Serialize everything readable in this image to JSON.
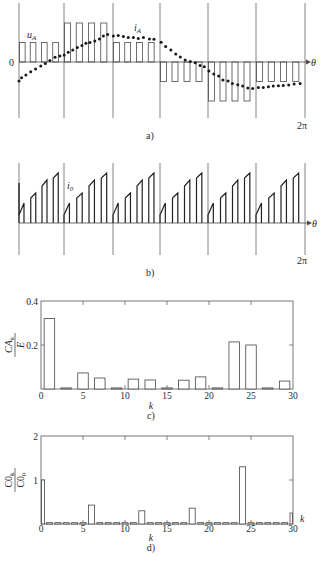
{
  "chart_data": [
    {
      "id": "a",
      "type": "line",
      "caption": "a)",
      "description": "Stepped PWM phase voltage u_A (6 segments x 4 pulses) with phase current i_A (dotted) over one period 0..2π",
      "origin_label": "0",
      "x_axis_symbol": "θ",
      "x_end_label": "2π",
      "u_label": "u",
      "u_label_sub": "A",
      "i_label": "i",
      "i_label_sub": "A",
      "segments": 6,
      "pulses_per_segment": 4,
      "u_A_segment_levels": [
        1,
        2,
        1,
        -1,
        -2,
        -1
      ],
      "i_A": {
        "theta_fraction_of_2pi": [
          0.0,
          0.009,
          0.024,
          0.041,
          0.058,
          0.076,
          0.092,
          0.108,
          0.126,
          0.143,
          0.158,
          0.172,
          0.188,
          0.204,
          0.22,
          0.234,
          0.248,
          0.265,
          0.281,
          0.295,
          0.31,
          0.33,
          0.347,
          0.365,
          0.382,
          0.4,
          0.417,
          0.435,
          0.456,
          0.472,
          0.497,
          0.513,
          0.531,
          0.548,
          0.564,
          0.581,
          0.599,
          0.616,
          0.633,
          0.648,
          0.664,
          0.681,
          0.698,
          0.713,
          0.731,
          0.746,
          0.765,
          0.782,
          0.8,
          0.817,
          0.837,
          0.854,
          0.872,
          0.889,
          0.907,
          0.924,
          0.943,
          0.962,
          0.983
        ],
        "values": [
          -0.95,
          -0.79,
          -0.65,
          -0.49,
          -0.35,
          -0.2,
          -0.07,
          0.07,
          0.24,
          0.3,
          0.35,
          0.49,
          0.6,
          0.72,
          0.82,
          0.94,
          0.97,
          1.05,
          1.15,
          1.3,
          1.37,
          1.3,
          1.32,
          1.27,
          1.22,
          1.22,
          1.17,
          1.22,
          1.15,
          1.14,
          0.99,
          0.77,
          0.6,
          0.4,
          0.25,
          0.1,
          0.02,
          -0.04,
          -0.17,
          -0.24,
          -0.45,
          -0.6,
          -0.7,
          -0.9,
          -0.95,
          -1.07,
          -1.14,
          -1.2,
          -1.3,
          -1.32,
          -1.27,
          -1.27,
          -1.24,
          -1.2,
          -1.19,
          -1.17,
          -1.15,
          -1.1,
          -1.07
        ]
      },
      "grid": "vertical lines at segment boundaries"
    },
    {
      "id": "b",
      "type": "line",
      "caption": "b)",
      "description": "DC-link current i_0: six identical segments of 4 ramped pulses each",
      "x_axis_symbol": "θ",
      "x_end_label": "2π",
      "i_label": "i",
      "i_label_sub": "0",
      "segments": 6,
      "pulses_per_segment": 4,
      "pulse_start_values": [
        0.8,
        2.5,
        3.7,
        4.5
      ],
      "pulse_end_values": [
        2.0,
        3.0,
        4.3,
        5.0
      ],
      "grid": "vertical lines at segment boundaries"
    },
    {
      "id": "c",
      "type": "bar",
      "caption": "c)",
      "ylabel_num": "CA",
      "ylabel_num_sub": "k",
      "ylabel_den": "E",
      "xlabel": "k",
      "xlim": [
        0,
        30
      ],
      "ylim": [
        0,
        0.4
      ],
      "x_ticks": [
        "0",
        "5",
        "10",
        "15",
        "20",
        "25",
        "30"
      ],
      "y_ticks": [
        "0.2",
        "0.4"
      ],
      "categories": [
        1,
        3,
        5,
        7,
        9,
        11,
        13,
        15,
        17,
        19,
        21,
        23,
        25,
        27,
        29
      ],
      "values": [
        0.32,
        0.005,
        0.073,
        0.05,
        0.005,
        0.045,
        0.041,
        0.005,
        0.04,
        0.055,
        0.005,
        0.214,
        0.2,
        0.005,
        0.036
      ]
    },
    {
      "id": "d",
      "type": "bar",
      "caption": "d)",
      "ylabel_num": "C0",
      "ylabel_num_sub": "k",
      "ylabel_den": "C0",
      "ylabel_den_sub": "0",
      "xlabel": "k",
      "xlabel_right": "k",
      "xlim": [
        0,
        30
      ],
      "ylim": [
        0,
        2
      ],
      "x_ticks": [
        "0",
        "5",
        "10",
        "15",
        "20",
        "25",
        "30"
      ],
      "y_ticks": [
        "1",
        "2"
      ],
      "categories": [
        0,
        1,
        2,
        3,
        4,
        5,
        6,
        7,
        8,
        9,
        10,
        11,
        12,
        13,
        14,
        15,
        16,
        17,
        18,
        19,
        20,
        21,
        22,
        23,
        24,
        25,
        26,
        27,
        28,
        29,
        30
      ],
      "values": [
        1.0,
        0.03,
        0.03,
        0.03,
        0.03,
        0.03,
        0.43,
        0.03,
        0.03,
        0.03,
        0.03,
        0.03,
        0.3,
        0.03,
        0.03,
        0.03,
        0.03,
        0.03,
        0.36,
        0.03,
        0.03,
        0.03,
        0.03,
        0.03,
        1.3,
        0.03,
        0.03,
        0.03,
        0.03,
        0.03,
        0.25
      ]
    }
  ]
}
